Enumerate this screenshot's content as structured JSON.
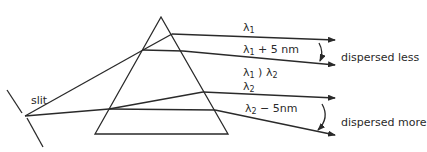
{
  "diagram": {
    "colors": {
      "stroke": "#2a2a2a",
      "background": "#ffffff"
    },
    "slit_label": "slit",
    "ray_labels": [
      {
        "id": "l1",
        "symbol": "λ",
        "sub": "1",
        "suffix": ""
      },
      {
        "id": "l1p5",
        "symbol": "λ",
        "sub": "1",
        "suffix": " + 5 nm"
      },
      {
        "id": "l1gtl2",
        "symbol": "λ",
        "sub": "1",
        "mid": " ) λ",
        "sub2": "2"
      },
      {
        "id": "l2",
        "symbol": "λ",
        "sub": "2",
        "suffix": ""
      },
      {
        "id": "l2m5",
        "symbol": "λ",
        "sub": "2",
        "suffix": " − 5nm"
      }
    ],
    "annotations": {
      "upper": "dispersed less",
      "lower": "dispersed more"
    }
  }
}
